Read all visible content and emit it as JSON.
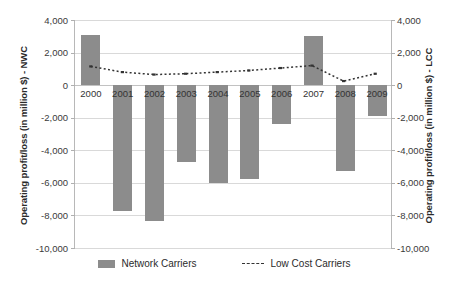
{
  "chart_data": {
    "type": "bar",
    "title": "",
    "xlabel": "",
    "ylabel": "Operating profit/loss (in million $) - NWC",
    "ylabel_right": "Operating profit/loss (in million $) - LCC",
    "categories": [
      "2000",
      "2001",
      "2002",
      "2003",
      "2004",
      "2005",
      "2006",
      "2007",
      "2008",
      "2009"
    ],
    "ylim": [
      -10000,
      4000
    ],
    "ylim_right": [
      -10000,
      4000
    ],
    "ytick_labels": [
      "4,000",
      "2,000",
      "0",
      "-2,000",
      "-4,000",
      "-6,000",
      "-8,000",
      "-10,000"
    ],
    "ytick_values": [
      4000,
      2000,
      0,
      -2000,
      -4000,
      -6000,
      -8000,
      -10000
    ],
    "grid": true,
    "legend_position": "bottom",
    "series": [
      {
        "name": "Network Carriers",
        "type": "bar",
        "axis": "left",
        "color": "#8c8c8c",
        "values": [
          3100,
          -7700,
          -8350,
          -4700,
          -6000,
          -5750,
          -2400,
          3000,
          -5300,
          -1900
        ]
      },
      {
        "name": "Low Cost Carriers",
        "type": "line",
        "axis": "right",
        "style": "dashed",
        "color": "#333333",
        "values": [
          1150,
          800,
          650,
          700,
          800,
          900,
          1050,
          1200,
          250,
          700
        ]
      }
    ]
  },
  "legend": {
    "items": [
      {
        "label": "Network Carriers",
        "marker": "bar-swatch"
      },
      {
        "label": "Low Cost Carriers",
        "marker": "dashed-line-swatch"
      }
    ]
  }
}
